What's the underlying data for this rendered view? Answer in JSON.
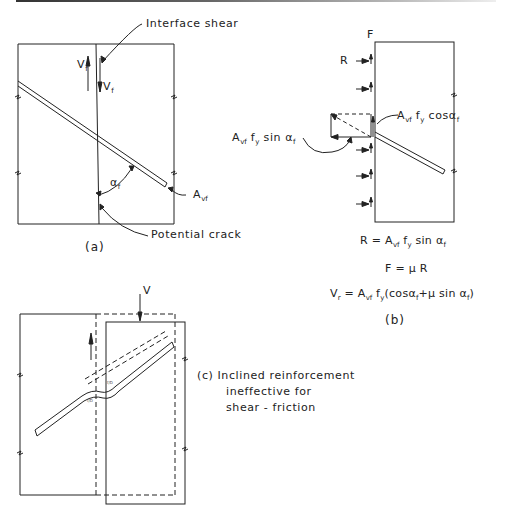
{
  "figure": {
    "panels": [
      {
        "id": "a",
        "caption": "(a)",
        "labels": {
          "interface_shear": "Interface shear",
          "vf_left": "V",
          "vf_left_sub": "f",
          "vf_right": "V",
          "vf_right_sub": "f",
          "alpha": "α",
          "alpha_sub": "f",
          "avf": "A",
          "avf_sub": "vf",
          "potential_crack": "Potential crack"
        }
      },
      {
        "id": "b",
        "caption": "(b)",
        "labels": {
          "F": "F",
          "R": "R",
          "sin_component": "A",
          "sin_component_sub": "vf",
          "sin_component_rest": " f",
          "sin_component_y": "y",
          "sin_component_tail": " sin α",
          "sin_component_tail_sub": "f",
          "cos_component": "A",
          "cos_component_sub": "vf",
          "cos_component_rest": " f",
          "cos_component_y": "y",
          "cos_component_tail": " cosα",
          "cos_component_tail_sub": "f"
        },
        "equations": {
          "eq1": {
            "lhs": "R = ",
            "A": "A",
            "A_sub": "vf",
            "f": " f",
            "f_sub": "y",
            "rest": " sin α",
            "rest_sub": "f"
          },
          "eq2": {
            "text": "F = μ R"
          },
          "eq3": {
            "lhs": "V",
            "lhs_sub": "r",
            "eq": " = A",
            "A_sub": "vf",
            "f": " f",
            "f_sub": "y",
            "p1": "(cosα",
            "p1_sub": "f",
            "p2": "+μ sin α",
            "p2_sub": "f",
            "close": ")"
          }
        }
      },
      {
        "id": "c",
        "caption_line1": "(c)  Inclined reinforcement",
        "caption_line2": "ineffective for",
        "caption_line3": "shear - friction",
        "labels": {
          "V": "V",
          "tiny1": "f/D",
          "tiny2": "f/D"
        }
      }
    ]
  }
}
